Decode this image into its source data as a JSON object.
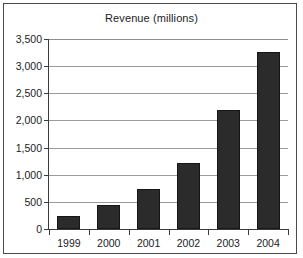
{
  "chart_data": {
    "type": "bar",
    "title": "Revenue (millions)",
    "xlabel": "",
    "ylabel": "",
    "categories": [
      "1999",
      "2000",
      "2001",
      "2002",
      "2003",
      "2004"
    ],
    "values": [
      240,
      440,
      740,
      1220,
      2190,
      3260
    ],
    "ylim": [
      0,
      3500
    ],
    "ytick_values": [
      0,
      500,
      1000,
      1500,
      2000,
      2500,
      3000,
      3500
    ],
    "ytick_labels": [
      "0",
      "500",
      "1,000",
      "1,500",
      "2,000",
      "2,500",
      "3,000",
      "3,500"
    ],
    "grid": true,
    "legend": false,
    "legend_position": "none",
    "bar_color": "#2b2b2b",
    "axis_color": "#3b3b3b",
    "grid_color": "#9a9a9a",
    "background_color": "#ffffff",
    "frame_color": "#4a4a4a"
  }
}
